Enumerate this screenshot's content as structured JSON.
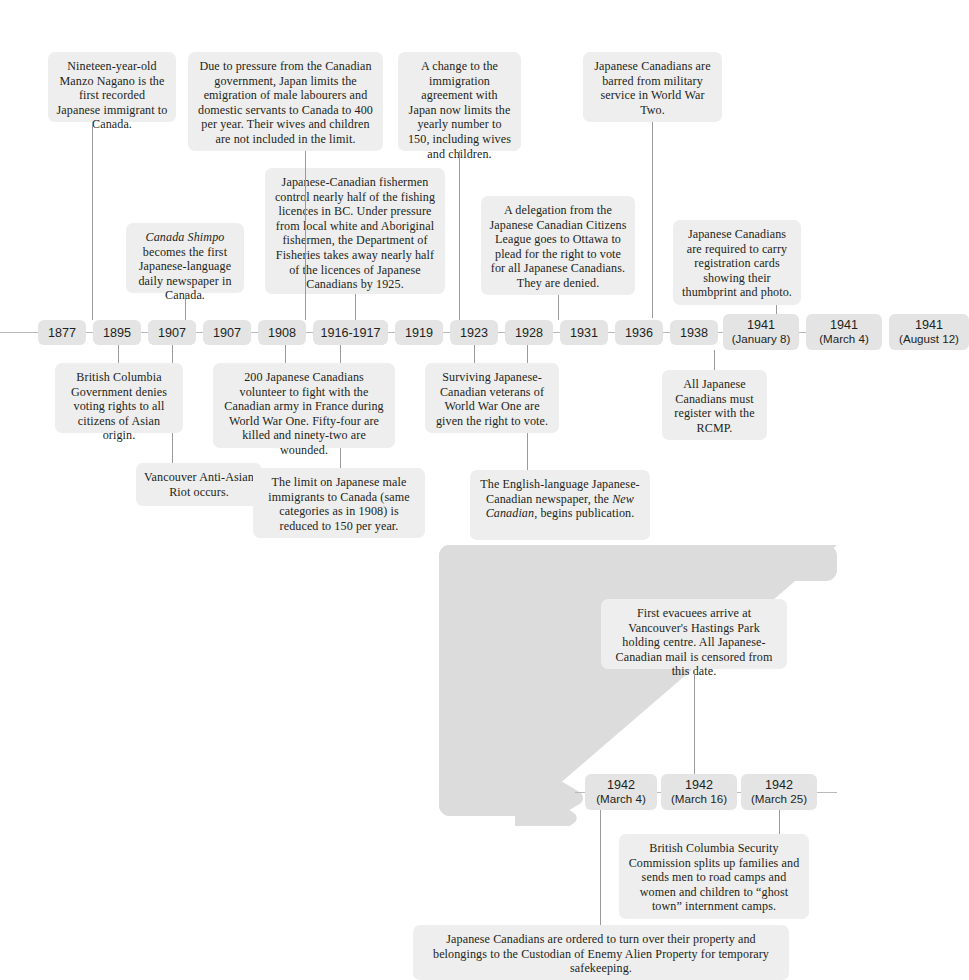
{
  "colors": {
    "note_bg": "#eeeeee",
    "year_bg": "#e4e4e4",
    "connector": "#9a9a9a",
    "arrow": "#dcdcdc",
    "text": "#231f20",
    "page_bg": "#ffffff"
  },
  "timeline": {
    "years": [
      {
        "year": "1877",
        "date": ""
      },
      {
        "year": "1895",
        "date": ""
      },
      {
        "year": "1907",
        "date": ""
      },
      {
        "year": "1907",
        "date": ""
      },
      {
        "year": "1908",
        "date": ""
      },
      {
        "year": "1916-1917",
        "date": ""
      },
      {
        "year": "1919",
        "date": ""
      },
      {
        "year": "1923",
        "date": ""
      },
      {
        "year": "1928",
        "date": ""
      },
      {
        "year": "1931",
        "date": ""
      },
      {
        "year": "1936",
        "date": ""
      },
      {
        "year": "1938",
        "date": ""
      },
      {
        "year": "1941",
        "date": "(January 8)"
      },
      {
        "year": "1941",
        "date": "(March 4)"
      },
      {
        "year": "1941",
        "date": "(August 12)"
      },
      {
        "year": "1942",
        "date": "(March 4)"
      },
      {
        "year": "1942",
        "date": "(March 16)"
      },
      {
        "year": "1942",
        "date": "(March 25)"
      }
    ]
  },
  "notes": {
    "n1877": "Nineteen-year-old Manzo Nagano is the first recorded Japanese immigrant to Canada.",
    "n1895": "British Columbia Government denies voting rights to all citizens of Asian origin.",
    "n1907a_pre": "",
    "n1907a_ital": "Canada Shimpo",
    "n1907a_post": " becomes the first Japanese-language daily newspaper in Canada.",
    "n1907b": "Vancouver Anti-Asian Riot occurs.",
    "n1908": "Due to pressure from the Canadian government, Japan limits the emigration of  male labourers and domestic servants to Canada to 400 per year. Their wives and children are not included in the limit.",
    "n1916": "200 Japanese Canadians volunteer to fight with the Canadian army in France during World War One. Fifty-four are killed and ninety-two are wounded.",
    "n1919": "Japanese-Canadian fishermen control nearly half of the fishing licences in BC. Under pressure from local white and Aboriginal fishermen, the Department of Fisheries takes away nearly half of the licences of Japanese Canadians by 1925.",
    "n1923": "The limit on Japanese male immigrants to Canada (same categories as in 1908) is reduced to 150 per year.",
    "n1928": "A change to the immigration agreement with Japan now limits the yearly number to 150, including wives and children.",
    "n1931": "Surviving Japanese-Canadian veterans of World War One are given the right to vote.",
    "n1936": "A delegation from the Japanese Canadian Citizens League goes to Ottawa to plead for the right to vote for all Japanese Canadians. They are denied.",
    "n1938_pre": "The English-language Japanese-Canadian newspaper, the ",
    "n1938_ital": "New Canadian",
    "n1938_post": ", begins publication.",
    "n1941jan": "Japanese Canadians are barred from military service in World War Two.",
    "n1941mar": "All Japanese Canadians must register with the RCMP.",
    "n1941aug": "Japanese Canadians are required to carry registration cards showing their thumbprint and photo.",
    "n1942mar16": "First evacuees arrive at Vancouver's Hastings Park holding centre. All Japanese-Canadian mail is censored from this date.",
    "n1942mar25": "British Columbia Security Commission splits up families and sends men to road camps and women and children to “ghost town” internment camps.",
    "n1942mar4": "Japanese Canadians are ordered to turn over their property and belongings to the Custodian of Enemy Alien Property for temporary safekeeping."
  }
}
